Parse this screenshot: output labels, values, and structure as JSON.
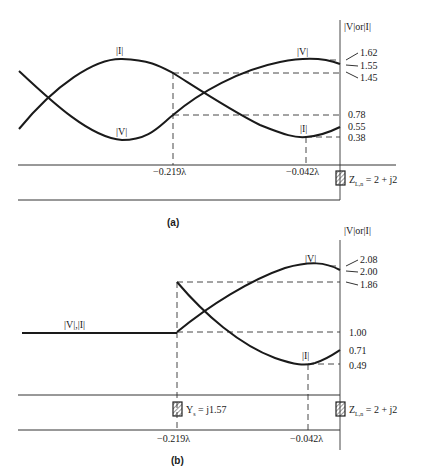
{
  "panel_a": {
    "caption": "(a)",
    "axis_title": "|V|or|I|",
    "curve_labels": {
      "I_peak": "|I|",
      "V_min": "|V|",
      "V_right": "|V|",
      "I_right": "|I|"
    },
    "ticks": [
      "1.62",
      "1.55",
      "1.45",
      "0.78",
      "0.55",
      "0.38"
    ],
    "positions": [
      "−0.219λ",
      "−0.042λ"
    ],
    "load": "Z",
    "load_sub": "L,n",
    "load_eq": " = 2 + j2"
  },
  "panel_b": {
    "caption": "(b)",
    "axis_title": "|V|or|I|",
    "curve_labels": {
      "flat": "|V|,|I|",
      "V_right": "|V|",
      "I_right": "|I|"
    },
    "ticks": [
      "2.08",
      "2.00",
      "1.86",
      "1.00",
      "0.71",
      "0.49"
    ],
    "positions": [
      "−0.219λ",
      "−0.042λ"
    ],
    "stub": "Y",
    "stub_sub": "s",
    "stub_eq": " = j1.57",
    "load": "Z",
    "load_sub": "L,n",
    "load_eq": " = 2 + j2"
  }
}
